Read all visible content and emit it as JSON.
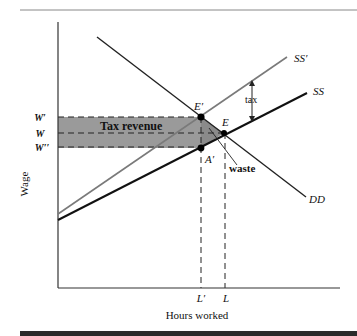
{
  "figure": {
    "y_axis_label": "Wage",
    "x_axis_label": "Hours worked",
    "curves": {
      "demand": "DD",
      "supply": "SS",
      "supply_taxed": "SS′"
    },
    "points": {
      "new_equilibrium": "E′",
      "equilibrium": "E",
      "after_tax_point": "A′"
    },
    "wage_ticks": {
      "gross_wage": "W′",
      "wage": "W",
      "net_wage": "W′′"
    },
    "hours_ticks": {
      "new_hours": "L′",
      "hours": "L"
    },
    "annotations": {
      "tax_revenue": "Tax revenue",
      "tax": "tax",
      "waste": "waste"
    },
    "colors": {
      "shaded_region": "#9a9a9a",
      "taxed_supply_line": "#7a7a7a",
      "lines": "#111111",
      "bottom_bar": "#2b2b2b"
    }
  }
}
